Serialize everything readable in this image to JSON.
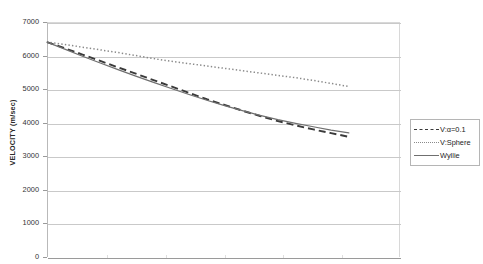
{
  "chart_data": {
    "type": "line",
    "title": "RELATIONSHIPS OF THE FORMS",
    "subtitle": "",
    "xlabel": "",
    "ylabel": "VELOCITY (m/sec)",
    "ylim": [
      0,
      7000
    ],
    "ytick_labels": [
      "7000",
      "6000",
      "5000",
      "4000",
      "3000",
      "2000",
      "1000",
      "0"
    ],
    "ytick_values": [
      7000,
      6000,
      5000,
      4000,
      3000,
      2000,
      1000,
      0
    ],
    "ytick_step": 1000,
    "grid": "horizontal",
    "legend_position": "right",
    "x": [
      0,
      0.05,
      0.1,
      0.15,
      0.2,
      0.25,
      0.3,
      0.35,
      0.4,
      0.45,
      0.5,
      0.55,
      0.6,
      0.65,
      0.7,
      0.75,
      0.8,
      0.85
    ],
    "series": [
      {
        "name": "V:α=0.1",
        "style": "dashed",
        "color": "#3a3a3a",
        "values": [
          6400,
          6220,
          6030,
          5840,
          5650,
          5460,
          5270,
          5080,
          4890,
          4700,
          4530,
          4360,
          4200,
          4050,
          3920,
          3800,
          3690,
          3580
        ]
      },
      {
        "name": "V:Sphere",
        "style": "dotted",
        "color": "#8a8a8a",
        "values": [
          6400,
          6330,
          6250,
          6170,
          6090,
          6000,
          5910,
          5830,
          5760,
          5690,
          5620,
          5550,
          5480,
          5410,
          5340,
          5260,
          5170,
          5080
        ]
      },
      {
        "name": "Wyllie",
        "style": "solid",
        "color": "#6f6f6f",
        "values": [
          6400,
          6190,
          5980,
          5780,
          5580,
          5390,
          5200,
          5020,
          4840,
          4670,
          4510,
          4360,
          4220,
          4090,
          3980,
          3880,
          3780,
          3700
        ]
      }
    ],
    "vertical_tick_count": 6
  },
  "legend": {
    "entries": [
      {
        "label": "V:α=0.1"
      },
      {
        "label": "V:Sphere"
      },
      {
        "label": "Wyllie"
      }
    ]
  }
}
